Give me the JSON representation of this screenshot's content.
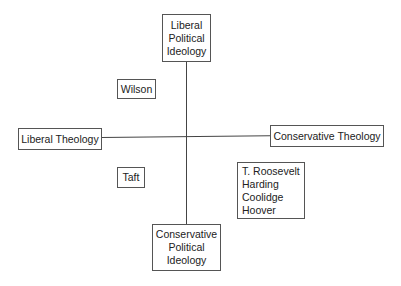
{
  "diagram": {
    "type": "quadrant",
    "axes": {
      "vertical": {
        "top_label": [
          "Liberal",
          "Political",
          "Ideology"
        ],
        "bottom_label": [
          "Conservative",
          "Political",
          "Ideology"
        ]
      },
      "horizontal": {
        "left_label": "Liberal Theology",
        "right_label": "Conservative Theology"
      }
    },
    "items": [
      {
        "quadrant": "top-left",
        "names": [
          "Wilson"
        ]
      },
      {
        "quadrant": "bottom-left",
        "names": [
          "Taft"
        ]
      },
      {
        "quadrant": "bottom-right",
        "names": [
          "T. Roosevelt",
          "Harding",
          "Coolidge",
          "Hoover"
        ]
      }
    ]
  }
}
